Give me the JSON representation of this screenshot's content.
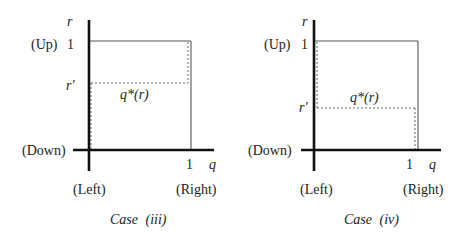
{
  "panels": [
    {
      "id": "case-iii",
      "caption_prefix": "Case",
      "caption_roman": "(iii)",
      "y_axis_label": "r",
      "x_axis_label": "q",
      "y_top_tick": "1",
      "y_top_name": "(Up)",
      "y_mid_label": "r'",
      "x_right_tick": "1",
      "origin_label": "(Down)",
      "x_left_name": "(Left)",
      "x_right_name": "(Right)",
      "curve_label": "q*(r)",
      "r_prime_level": 0.68
    },
    {
      "id": "case-iv",
      "caption_prefix": "Case",
      "caption_roman": "(iv)",
      "y_axis_label": "r",
      "x_axis_label": "q",
      "y_top_tick": "1",
      "y_top_name": "(Up)",
      "y_mid_label": "r'",
      "x_right_tick": "1",
      "origin_label": "(Down)",
      "x_left_name": "(Left)",
      "x_right_name": "(Right)",
      "curve_label": "q*(r)",
      "r_prime_level": 0.39
    }
  ]
}
